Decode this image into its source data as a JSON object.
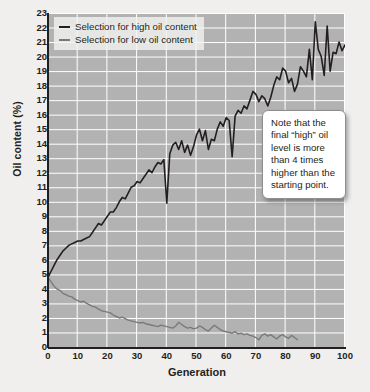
{
  "chart_data": {
    "type": "line",
    "title": "",
    "xlabel": "Generation",
    "ylabel": "Oil content (%)",
    "xlim": [
      0,
      100
    ],
    "ylim": [
      0,
      23
    ],
    "xticks": [
      0,
      10,
      20,
      30,
      40,
      50,
      60,
      70,
      80,
      90,
      100
    ],
    "yticks": [
      0,
      1,
      2,
      3,
      4,
      5,
      6,
      7,
      8,
      9,
      10,
      11,
      12,
      13,
      14,
      15,
      16,
      17,
      18,
      19,
      20,
      21,
      22,
      23
    ],
    "grid": true,
    "grid_color": "#ffffff",
    "plot_background": "#b3b2b2",
    "legend_position": "top-left",
    "series": [
      {
        "name": "Selection for high oil content",
        "color": "#231f20",
        "x": [
          0,
          1,
          2,
          3,
          4,
          5,
          6,
          7,
          8,
          9,
          10,
          11,
          12,
          13,
          14,
          15,
          16,
          17,
          18,
          19,
          20,
          21,
          22,
          23,
          24,
          25,
          26,
          27,
          28,
          29,
          30,
          31,
          32,
          33,
          34,
          35,
          36,
          37,
          38,
          39,
          40,
          41,
          42,
          43,
          44,
          45,
          46,
          47,
          48,
          49,
          50,
          51,
          52,
          53,
          54,
          55,
          56,
          57,
          58,
          59,
          60,
          61,
          62,
          63,
          64,
          65,
          66,
          67,
          68,
          69,
          70,
          71,
          72,
          73,
          74,
          75,
          76,
          77,
          78,
          79,
          80,
          81,
          82,
          83,
          84,
          85,
          86,
          87,
          88,
          89,
          90,
          91,
          92,
          93,
          94,
          95,
          96,
          97,
          98,
          99,
          100
        ],
        "y": [
          4.8,
          5.2,
          5.6,
          6.0,
          6.3,
          6.6,
          6.8,
          7.0,
          7.1,
          7.2,
          7.3,
          7.3,
          7.4,
          7.5,
          7.6,
          7.9,
          8.2,
          8.5,
          8.4,
          8.7,
          9.0,
          9.3,
          9.3,
          9.6,
          10.0,
          10.3,
          10.2,
          10.6,
          11.0,
          11.1,
          11.4,
          11.3,
          11.6,
          11.9,
          12.2,
          12.0,
          12.4,
          12.7,
          12.6,
          12.9,
          9.9,
          13.3,
          13.9,
          14.1,
          13.6,
          14.2,
          13.4,
          13.9,
          13.2,
          13.8,
          14.6,
          15.0,
          14.2,
          14.9,
          13.6,
          14.3,
          14.2,
          15.0,
          15.5,
          15.2,
          15.8,
          15.6,
          13.1,
          15.9,
          16.3,
          16.1,
          16.6,
          16.4,
          17.0,
          17.6,
          17.4,
          16.9,
          17.3,
          17.1,
          16.6,
          17.2,
          18.0,
          18.6,
          18.4,
          19.2,
          19.0,
          18.2,
          18.5,
          17.6,
          18.1,
          19.3,
          19.0,
          18.6,
          20.5,
          18.4,
          22.4,
          20.5,
          20.0,
          18.7,
          22.1,
          19.0,
          20.3,
          20.2,
          21.0,
          20.4,
          20.8
        ]
      },
      {
        "name": "Selection for low oil content",
        "color": "#7b7a7a",
        "x": [
          0,
          1,
          2,
          3,
          4,
          5,
          6,
          7,
          8,
          9,
          10,
          11,
          12,
          13,
          14,
          15,
          16,
          17,
          18,
          19,
          20,
          21,
          22,
          23,
          24,
          25,
          26,
          27,
          28,
          29,
          30,
          31,
          32,
          33,
          34,
          35,
          36,
          37,
          38,
          39,
          40,
          41,
          42,
          43,
          44,
          45,
          46,
          47,
          48,
          49,
          50,
          51,
          52,
          53,
          54,
          55,
          56,
          57,
          58,
          59,
          60,
          61,
          62,
          63,
          64,
          65,
          66,
          67,
          68,
          69,
          70,
          71,
          72,
          73,
          74,
          75,
          76,
          77,
          78,
          79,
          80,
          81,
          82,
          83,
          84
        ],
        "y": [
          4.8,
          4.5,
          4.2,
          4.0,
          3.9,
          3.7,
          3.6,
          3.5,
          3.45,
          3.3,
          3.2,
          3.1,
          3.15,
          3.0,
          2.9,
          2.8,
          2.75,
          2.6,
          2.5,
          2.45,
          2.4,
          2.35,
          2.2,
          2.1,
          2.0,
          2.05,
          1.95,
          1.85,
          1.8,
          1.75,
          1.7,
          1.65,
          1.7,
          1.6,
          1.55,
          1.5,
          1.45,
          1.4,
          1.5,
          1.45,
          1.4,
          1.35,
          1.3,
          1.45,
          1.7,
          1.55,
          1.4,
          1.3,
          1.35,
          1.25,
          1.3,
          1.45,
          1.35,
          1.2,
          1.1,
          1.3,
          1.5,
          1.35,
          1.2,
          1.1,
          1.05,
          1.0,
          0.95,
          1.05,
          0.9,
          0.95,
          0.85,
          0.9,
          0.8,
          0.75,
          0.65,
          0.5,
          0.8,
          0.9,
          0.75,
          0.85,
          0.7,
          0.55,
          0.75,
          0.85,
          0.7,
          0.6,
          0.8,
          0.65,
          0.5
        ]
      }
    ],
    "annotations": [
      {
        "name": "note-callout",
        "text": "Note that the final “high” oil level is more than 4 times higher than the starting point."
      }
    ]
  },
  "legend": {
    "items": [
      {
        "label": "Selection for high oil content",
        "color": "#231f20"
      },
      {
        "label": "Selection for low oil content",
        "color": "#7b7a7a"
      }
    ]
  },
  "axes": {
    "x_title": "Generation",
    "y_title": "Oil content (%)"
  },
  "callout": {
    "text": "Note that the final “high” oil level is more than 4 times higher than the starting point."
  }
}
